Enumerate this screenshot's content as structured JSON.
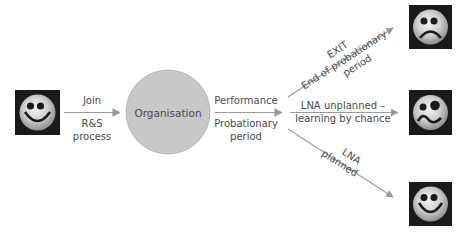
{
  "diagram": {
    "nodes": {
      "employee": {
        "face": "happy"
      },
      "organisation": {
        "label": "Organisation"
      },
      "outcome_exit": {
        "face": "sad"
      },
      "outcome_unplanned": {
        "face": "confused"
      },
      "outcome_planned": {
        "face": "happy"
      }
    },
    "edges": {
      "join": {
        "above": "Join",
        "below_1": "R&S",
        "below_2": "process"
      },
      "performance": {
        "above": "Performance",
        "below_1": "Probationary",
        "below_2": "period"
      },
      "exit": {
        "line_1": "EXIT",
        "line_2": "End of probationary",
        "line_3": "period"
      },
      "unplanned": {
        "line_1": "LNA unplanned –",
        "line_2": "learning by chance"
      },
      "planned": {
        "line_1": "LNA",
        "line_2": "planned"
      }
    }
  },
  "colors": {
    "arrow": "#9a9a9a",
    "circle_fill": "#c8c8c8",
    "circle_stroke": "#a8a8a8",
    "text": "#4a4a4a",
    "face_bg": "#1a1a1a"
  }
}
